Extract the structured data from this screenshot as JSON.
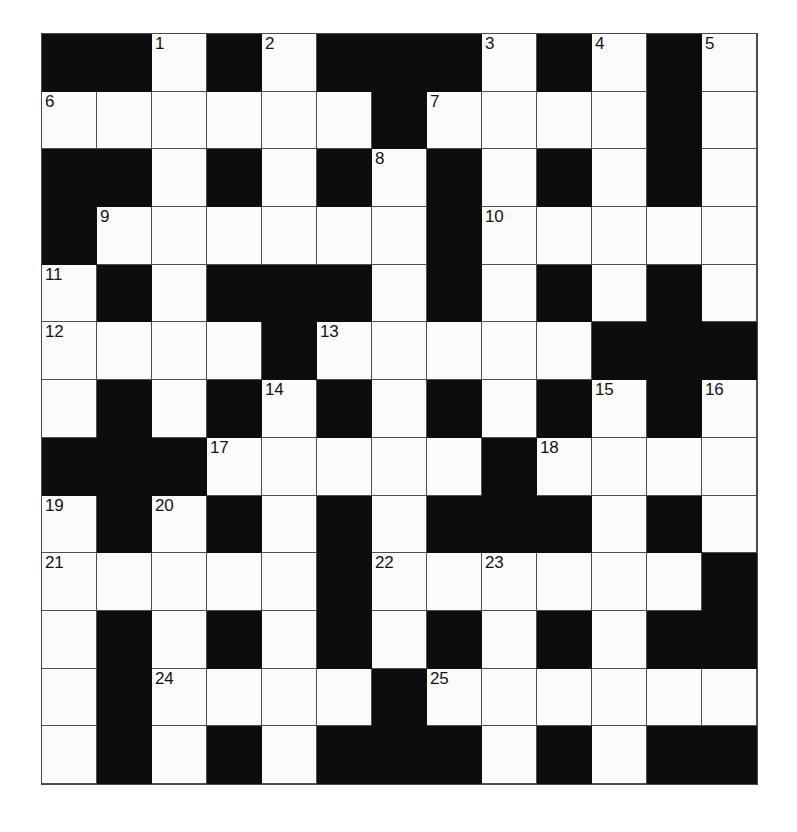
{
  "puzzle": {
    "title": "Crossword Grid",
    "rows": 13,
    "cols": 13,
    "colors": {
      "block": "#0d0d0d",
      "cell": "#fbfbfa",
      "gridline": "#4f4f4f",
      "number_text": "#141414",
      "page_background": "#ffffff"
    },
    "grid": [
      [
        "B",
        "B",
        "W",
        "B",
        "W",
        "B",
        "B",
        "B",
        "W",
        "B",
        "W",
        "B",
        "W"
      ],
      [
        "W",
        "W",
        "W",
        "W",
        "W",
        "W",
        "B",
        "W",
        "W",
        "W",
        "W",
        "B",
        "W"
      ],
      [
        "B",
        "B",
        "W",
        "B",
        "W",
        "B",
        "W",
        "B",
        "W",
        "B",
        "W",
        "B",
        "W"
      ],
      [
        "B",
        "W",
        "W",
        "W",
        "W",
        "W",
        "W",
        "B",
        "W",
        "W",
        "W",
        "W",
        "W"
      ],
      [
        "W",
        "B",
        "W",
        "B",
        "B",
        "B",
        "W",
        "B",
        "W",
        "B",
        "W",
        "B",
        "W"
      ],
      [
        "W",
        "W",
        "W",
        "W",
        "B",
        "W",
        "W",
        "W",
        "W",
        "W",
        "B",
        "B",
        "B"
      ],
      [
        "W",
        "B",
        "W",
        "B",
        "W",
        "B",
        "W",
        "B",
        "W",
        "B",
        "W",
        "B",
        "W"
      ],
      [
        "B",
        "B",
        "B",
        "W",
        "W",
        "W",
        "W",
        "W",
        "B",
        "W",
        "W",
        "W",
        "W"
      ],
      [
        "W",
        "B",
        "W",
        "B",
        "W",
        "B",
        "W",
        "B",
        "B",
        "B",
        "W",
        "B",
        "W"
      ],
      [
        "W",
        "W",
        "W",
        "W",
        "W",
        "B",
        "W",
        "W",
        "W",
        "W",
        "W",
        "W",
        "B"
      ],
      [
        "W",
        "B",
        "W",
        "B",
        "W",
        "B",
        "W",
        "B",
        "W",
        "B",
        "W",
        "B",
        "B"
      ],
      [
        "W",
        "B",
        "W",
        "W",
        "W",
        "W",
        "B",
        "W",
        "W",
        "W",
        "W",
        "W",
        "W"
      ],
      [
        "W",
        "B",
        "W",
        "B",
        "W",
        "B",
        "B",
        "B",
        "W",
        "B",
        "W",
        "B",
        "B"
      ]
    ],
    "numbers": [
      {
        "row": 0,
        "col": 2,
        "n": "1"
      },
      {
        "row": 0,
        "col": 4,
        "n": "2"
      },
      {
        "row": 0,
        "col": 8,
        "n": "3"
      },
      {
        "row": 0,
        "col": 10,
        "n": "4"
      },
      {
        "row": 0,
        "col": 12,
        "n": "5"
      },
      {
        "row": 1,
        "col": 0,
        "n": "6"
      },
      {
        "row": 1,
        "col": 7,
        "n": "7"
      },
      {
        "row": 2,
        "col": 6,
        "n": "8"
      },
      {
        "row": 3,
        "col": 1,
        "n": "9"
      },
      {
        "row": 3,
        "col": 8,
        "n": "10"
      },
      {
        "row": 4,
        "col": 0,
        "n": "11"
      },
      {
        "row": 5,
        "col": 0,
        "n": "12"
      },
      {
        "row": 5,
        "col": 5,
        "n": "13"
      },
      {
        "row": 6,
        "col": 4,
        "n": "14"
      },
      {
        "row": 6,
        "col": 10,
        "n": "15"
      },
      {
        "row": 6,
        "col": 12,
        "n": "16"
      },
      {
        "row": 7,
        "col": 3,
        "n": "17"
      },
      {
        "row": 7,
        "col": 9,
        "n": "18"
      },
      {
        "row": 8,
        "col": 0,
        "n": "19"
      },
      {
        "row": 8,
        "col": 2,
        "n": "20"
      },
      {
        "row": 9,
        "col": 0,
        "n": "21"
      },
      {
        "row": 9,
        "col": 6,
        "n": "22"
      },
      {
        "row": 9,
        "col": 8,
        "n": "23"
      },
      {
        "row": 11,
        "col": 2,
        "n": "24"
      },
      {
        "row": 11,
        "col": 7,
        "n": "25"
      }
    ],
    "letters": []
  }
}
